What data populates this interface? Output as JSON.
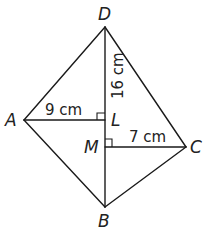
{
  "diagram": {
    "vertices": [
      {
        "id": "D",
        "label": "D",
        "x": 105,
        "y": 27
      },
      {
        "id": "A",
        "label": "A",
        "x": 24,
        "y": 120
      },
      {
        "id": "C",
        "label": "C",
        "x": 186,
        "y": 147
      },
      {
        "id": "B",
        "label": "B",
        "x": 105,
        "y": 207
      },
      {
        "id": "L",
        "label": "L",
        "x": 105,
        "y": 120
      },
      {
        "id": "M",
        "label": "M",
        "x": 105,
        "y": 147
      }
    ],
    "measurements": {
      "AL": "9 cm",
      "DL": "16 cm",
      "MC": "7 cm"
    },
    "right_angles": [
      "L",
      "M"
    ]
  }
}
